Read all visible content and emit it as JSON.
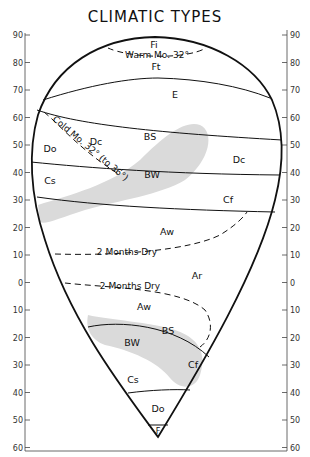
{
  "title": "CLIMATIC TYPES",
  "axes": {
    "left_ticks": [
      "90",
      "80",
      "70",
      "60",
      "50",
      "40",
      "30",
      "20",
      "10",
      "0",
      "10",
      "20",
      "30",
      "40",
      "50",
      "60"
    ],
    "right_ticks": [
      "90",
      "80",
      "70",
      "60",
      "50",
      "40",
      "30",
      "20",
      "10",
      "0",
      "10",
      "20",
      "30",
      "40",
      "50",
      "60"
    ]
  },
  "zones": {
    "fi": "Fi",
    "ft": "Ft",
    "e": "E",
    "do_north": "Do",
    "dc_west": "Dc",
    "bs_north": "BS",
    "dc_east": "Dc",
    "cs_north": "Cs",
    "bw_north": "BW",
    "cf_north": "Cf",
    "aw_north": "Aw",
    "ar": "Ar",
    "aw_south": "Aw",
    "bs_south": "BS",
    "bw_south": "BW",
    "cs_south": "Cs",
    "cf_south": "Cf",
    "do_south": "Do",
    "f_south": "F"
  },
  "isolines": {
    "warm_month": "Warm Mo. 32°",
    "cold_month": "Cold Mo. 32° (to 36°)",
    "dry_north": "2  Months Dry",
    "dry_south": "2  Months  Dry"
  },
  "colors": {
    "line": "#111111",
    "arid_shading": "#d9d9d9",
    "axis": "#444444"
  }
}
